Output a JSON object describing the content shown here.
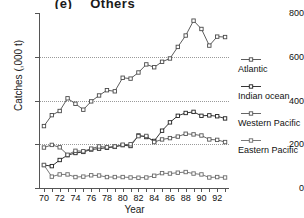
{
  "chart_data": {
    "type": "line",
    "panel_label": "(e)",
    "title": "Others",
    "xlabel": "Year",
    "ylabel": "Catches (,000 t)",
    "xlim": [
      69.5,
      93.5
    ],
    "ylim": [
      0,
      800
    ],
    "yticks": [
      0,
      200,
      400,
      600,
      800
    ],
    "ytick_labels": [
      "0",
      "200",
      "400",
      "600",
      "800"
    ],
    "xticks": [
      70,
      71,
      72,
      73,
      74,
      75,
      76,
      77,
      78,
      79,
      80,
      81,
      82,
      83,
      84,
      85,
      86,
      87,
      88,
      89,
      90,
      91,
      92,
      93
    ],
    "xtick_labels_shown": [
      "70",
      "72",
      "74",
      "76",
      "78",
      "80",
      "82",
      "84",
      "86",
      "88",
      "90",
      "92"
    ],
    "grid": "horizontal-dotted",
    "legend_position": "right",
    "marker": "square",
    "x": [
      70,
      71,
      72,
      73,
      74,
      75,
      76,
      77,
      78,
      79,
      80,
      81,
      82,
      83,
      84,
      85,
      86,
      87,
      88,
      89,
      90,
      91,
      92,
      93
    ],
    "series": [
      {
        "name": "Atlantic",
        "color": "#4a4a4a",
        "values": [
          283,
          333,
          352,
          410,
          385,
          358,
          396,
          423,
          447,
          442,
          504,
          500,
          528,
          565,
          552,
          577,
          592,
          645,
          697,
          765,
          727,
          651,
          692,
          690
        ]
      },
      {
        "name": "Indian ocean",
        "color": "#1f1f1f",
        "values": [
          105,
          100,
          128,
          150,
          160,
          165,
          176,
          180,
          184,
          188,
          196,
          192,
          240,
          233,
          215,
          262,
          300,
          330,
          343,
          348,
          330,
          332,
          328,
          318
        ]
      },
      {
        "name": "Western Pacific",
        "color": "#555555",
        "values": [
          185,
          197,
          186,
          152,
          170,
          168,
          180,
          190,
          186,
          190,
          198,
          200,
          237,
          238,
          210,
          222,
          228,
          235,
          248,
          245,
          240,
          222,
          220,
          210
        ]
      },
      {
        "name": "Eastern Pacific",
        "color": "#6a6a6a",
        "values": [
          105,
          52,
          62,
          62,
          50,
          52,
          58,
          57,
          50,
          50,
          50,
          48,
          47,
          48,
          56,
          68,
          66,
          70,
          73,
          66,
          62,
          48,
          50,
          48
        ]
      }
    ]
  }
}
